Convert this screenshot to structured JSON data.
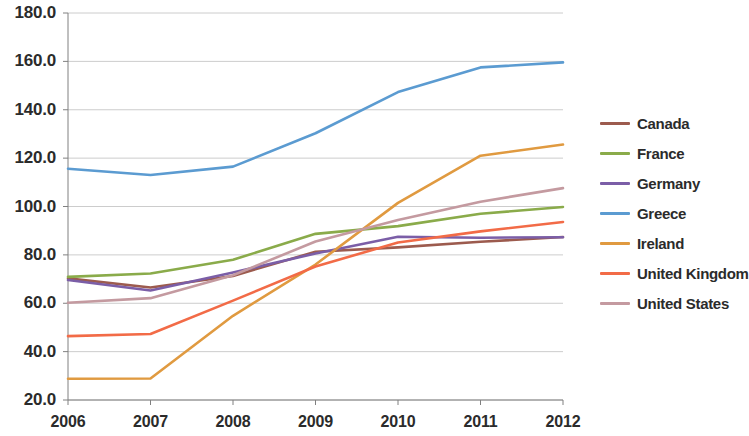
{
  "chart_data": {
    "type": "line",
    "title": "",
    "xlabel": "",
    "ylabel": "",
    "x": [
      2006,
      2007,
      2008,
      2009,
      2010,
      2011,
      2012
    ],
    "xtick_labels": [
      "2006",
      "2007",
      "2008",
      "2009",
      "2010",
      "2011",
      "2012"
    ],
    "ytick_labels": [
      "180.0",
      "160.0",
      "140.0",
      "120.0",
      "100.0",
      "80.0",
      "60.0",
      "40.0",
      "20.0"
    ],
    "ytick_values": [
      180.0,
      160.0,
      140.0,
      120.0,
      100.0,
      80.0,
      60.0,
      40.0,
      20.0
    ],
    "ylim": [
      20.0,
      180.0
    ],
    "xlim": [
      2006,
      2012
    ],
    "grid": true,
    "grid_axis": "y",
    "legend_position": "right",
    "series": [
      {
        "name": "Canada",
        "color": "#9c5b4e",
        "values": [
          70.3,
          66.5,
          71.3,
          81.3,
          83.1,
          85.4,
          87.4
        ]
      },
      {
        "name": "France",
        "color": "#8aab4a",
        "values": [
          70.9,
          72.3,
          78.0,
          88.7,
          91.9,
          97.0,
          99.8
        ]
      },
      {
        "name": "Germany",
        "color": "#7b5ea7",
        "values": [
          69.6,
          65.3,
          72.7,
          80.6,
          87.5,
          87.1,
          87.3
        ]
      },
      {
        "name": "Greece",
        "color": "#5b9bd1",
        "values": [
          115.6,
          113.0,
          116.5,
          130.3,
          147.3,
          157.5,
          159.6
        ]
      },
      {
        "name": "Ireland",
        "color": "#e09a40",
        "values": [
          28.8,
          28.9,
          54.8,
          76.0,
          101.5,
          121.0,
          125.6
        ]
      },
      {
        "name": "United Kingdom",
        "color": "#f26b47",
        "values": [
          46.4,
          47.3,
          61.1,
          75.2,
          85.1,
          89.7,
          93.6
        ]
      },
      {
        "name": "United States",
        "color": "#c49aa0",
        "values": [
          60.2,
          62.1,
          71.6,
          85.5,
          94.4,
          102.0,
          107.6
        ]
      }
    ]
  },
  "legend": {
    "items": [
      {
        "label": "Canada"
      },
      {
        "label": "France"
      },
      {
        "label": "Germany"
      },
      {
        "label": "Greece"
      },
      {
        "label": "Ireland"
      },
      {
        "label": "United Kingdom"
      },
      {
        "label": "United States"
      }
    ]
  },
  "colors": {
    "axis": "#808080",
    "grid": "#bfbfbf",
    "text": "#2b2b2b",
    "background": "#ffffff"
  }
}
